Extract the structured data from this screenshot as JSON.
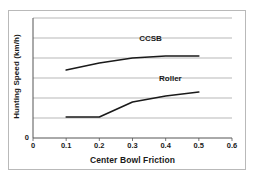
{
  "chart_data": {
    "type": "line",
    "title": "",
    "xlabel": "Center Bowl Friction",
    "ylabel": "Hunting Speed (km/h)",
    "xlim": [
      0,
      0.6
    ],
    "ylim": [
      0,
      6
    ],
    "xticks": [
      "0",
      "0.1",
      "0.2",
      "0.3",
      "0.4",
      "0.5",
      "0.6"
    ],
    "xtick_values": [
      0,
      0.1,
      0.2,
      0.3,
      0.4,
      0.5,
      0.6
    ],
    "yticks": [
      "0"
    ],
    "ytick_values": [
      0
    ],
    "grid": "horizontal",
    "legend_position": "inline-annotation",
    "line_color": "#1a1a1a",
    "grid_color": "#9a9a9a",
    "axis_color": "#555555",
    "series": [
      {
        "name": "CCSB",
        "label_x": 0.32,
        "label_y": 4.95,
        "x": [
          0.1,
          0.2,
          0.3,
          0.4,
          0.5
        ],
        "y": [
          3.4,
          3.75,
          4.0,
          4.1,
          4.1
        ]
      },
      {
        "name": "Roller",
        "label_x": 0.38,
        "label_y": 2.95,
        "x": [
          0.1,
          0.2,
          0.3,
          0.4,
          0.5
        ],
        "y": [
          1.05,
          1.05,
          1.8,
          2.1,
          2.3
        ]
      }
    ]
  }
}
